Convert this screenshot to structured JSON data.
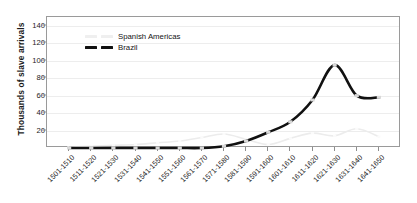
{
  "chart_data": {
    "type": "line",
    "title": "",
    "xlabel": "",
    "ylabel": "Thousands of slave arrivals",
    "ylim": [
      0,
      150
    ],
    "yticks": [
      20,
      40,
      60,
      80,
      100,
      120,
      140
    ],
    "grid": true,
    "legend_position": "top-left-inside",
    "categories": [
      "1501-1510",
      "1511-1520",
      "1521-1530",
      "1531-1540",
      "1541-1550",
      "1551-1560",
      "1561-1570",
      "1571-1580",
      "1581-1590",
      "1591-1600",
      "1601-1610",
      "1611-1620",
      "1621-1630",
      "1631-1640",
      "1641-1650"
    ],
    "series": [
      {
        "name": "Spanish Americas",
        "color": "#ececec",
        "style": "dashed",
        "values": [
          1,
          2,
          3,
          4,
          6,
          8,
          12,
          16,
          10,
          4,
          11,
          17,
          14,
          22,
          13
        ]
      },
      {
        "name": "Brazil",
        "color": "#111111",
        "style": "dashed-marker",
        "values": [
          0,
          0,
          0,
          0,
          0,
          0,
          0,
          2,
          8,
          18,
          30,
          55,
          95,
          60,
          58
        ]
      }
    ]
  },
  "axis": {
    "y_title": "Thousands of slave arrivals",
    "y_tick_labels": [
      "20",
      "40",
      "60",
      "80",
      "100",
      "120",
      "140"
    ],
    "x_tick_labels": [
      "1501-1510",
      "1511-1520",
      "1521-1530",
      "1531-1540",
      "1541-1550",
      "1551-1560",
      "1561-1570",
      "1571-1580",
      "1581-1590",
      "1591-1600",
      "1601-1610",
      "1611-1620",
      "1621-1630",
      "1631-1640",
      "1641-1650"
    ]
  },
  "legend": {
    "entries": [
      {
        "label": "Spanish Americas",
        "color": "#ececec"
      },
      {
        "label": "Brazil",
        "color": "#111111"
      }
    ]
  }
}
